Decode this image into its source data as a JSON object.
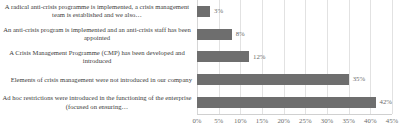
{
  "chart_data": {
    "type": "bar",
    "orientation": "horizontal",
    "title": "",
    "subtitle": "",
    "xlabel": "",
    "ylabel": "",
    "xlim": [
      0,
      45
    ],
    "xtick_step": 5,
    "grid": true,
    "legend": false,
    "bar_color": "#6e6e6e",
    "label_color": "#3a3a3a",
    "tick_color": "#6b6b6b",
    "gridline_color": "#e2e2e2",
    "categories": [
      "A radical anti-crisis programme is implemented, a crisis management team is established and we also…",
      "An anti-crisis program is implemented and an anti-crisis staff has been appointed",
      "A Crisis Management Programme (CMP) has been developed and introduced",
      "Elements of crisis management were not introduced in our company",
      "Ad hoc restrictions were introduced in the functioning of the enterprise (focused on ensuring…"
    ],
    "values": [
      3,
      8,
      12,
      35,
      42
    ],
    "data_labels": [
      "3%",
      "8%",
      "12%",
      "35%",
      "42%"
    ],
    "xtick_labels": [
      "0%",
      "5%",
      "10%",
      "15%",
      "20%",
      "25%",
      "30%",
      "35%",
      "40%",
      "45%"
    ],
    "xtick_values": [
      0,
      5,
      10,
      15,
      20,
      25,
      30,
      35,
      40,
      45
    ]
  }
}
